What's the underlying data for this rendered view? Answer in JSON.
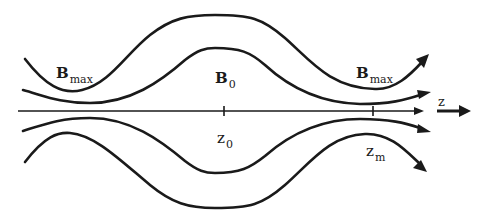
{
  "diagram": {
    "colors": {
      "ink": "#1a1a1a",
      "background": "#ffffff"
    },
    "labels": {
      "bmax_left": {
        "main": "B",
        "sub": "max"
      },
      "b0": {
        "main": "B",
        "sub": "0"
      },
      "bmax_right": {
        "main": "B",
        "sub": "max"
      },
      "z0": {
        "main": "z",
        "sub": "0"
      },
      "zm": {
        "main": "z",
        "sub": "m"
      },
      "z_axis": {
        "main": "z"
      }
    },
    "elements": {
      "field_lines": [
        "outer-top",
        "inner-top",
        "inner-bottom",
        "outer-bottom"
      ],
      "axis": {
        "ticks": [
          "z0",
          "zm"
        ]
      },
      "direction_arrow": "z"
    }
  }
}
